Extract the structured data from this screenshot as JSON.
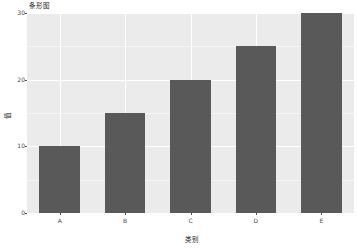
{
  "chart_data": {
    "type": "bar",
    "title": "条形图",
    "subtitle": "",
    "xlabel": "类别",
    "ylabel": "值",
    "categories": [
      "A",
      "B",
      "C",
      "D",
      "E"
    ],
    "values": [
      10,
      15,
      20,
      25,
      30
    ],
    "series": [
      {
        "name": "值",
        "values": [
          10,
          15,
          20,
          25,
          30
        ]
      }
    ],
    "ylim": [
      0,
      30
    ],
    "y_ticks": [
      0,
      10,
      20,
      30
    ],
    "y_tick_labels": [
      "0",
      "10",
      "20",
      "30"
    ],
    "x_tick_labels": [
      "A",
      "B",
      "C",
      "D",
      "E"
    ],
    "grid": true,
    "grid_color": "#ffffff",
    "legend": false,
    "legend_position": "none",
    "bar_color": "#595959",
    "panel_background": "#ebebeb",
    "figure_background": "#ffffff",
    "text_color": "#4d4d4d"
  }
}
